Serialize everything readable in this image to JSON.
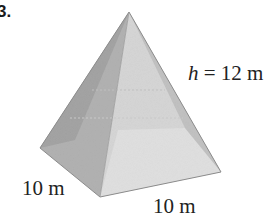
{
  "problem": {
    "number": "3."
  },
  "figure": {
    "shape": "square pyramid",
    "labels": {
      "height_var": "h",
      "height_rest": " = 12 m",
      "base_left": "10 m",
      "base_right": "10 m"
    },
    "colors": {
      "left_face": "#a9a9a9",
      "front_face": "#d4d4d4",
      "right_face": "#bdbdbd",
      "front_light": "#e2e2e2",
      "edge": "#8a8a8a"
    }
  }
}
